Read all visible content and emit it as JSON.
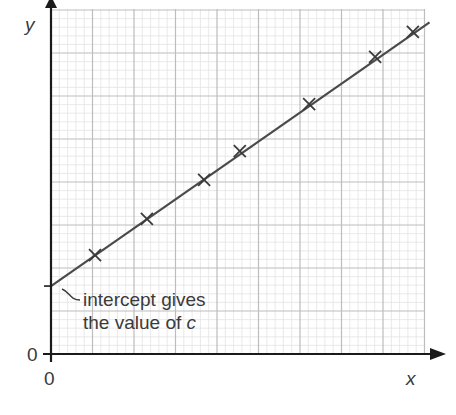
{
  "chart_data": {
    "type": "scatter",
    "title": "",
    "xlabel": "x",
    "ylabel": "y",
    "x_origin_label": "0",
    "y_origin_label": "0",
    "grid": true,
    "grid_major_cells_x": 9,
    "grid_major_cells_y": 8,
    "minor_per_major": 5,
    "xlim": [
      0,
      9
    ],
    "ylim": [
      0,
      8
    ],
    "series": [
      {
        "name": "data points",
        "marker": "x",
        "points": [
          {
            "x": 1.06,
            "y": 2.3
          },
          {
            "x": 2.31,
            "y": 3.14
          },
          {
            "x": 3.69,
            "y": 4.05
          },
          {
            "x": 4.55,
            "y": 4.72
          },
          {
            "x": 6.22,
            "y": 5.81
          },
          {
            "x": 7.81,
            "y": 6.91
          },
          {
            "x": 8.72,
            "y": 7.49
          }
        ]
      },
      {
        "name": "line of best fit",
        "type": "line",
        "points": [
          {
            "x": 0,
            "y": 1.58
          },
          {
            "x": 9.0,
            "y": 7.63
          }
        ]
      }
    ],
    "annotations": [
      {
        "text_line1": "intercept gives",
        "text_line2_prefix": "the value of ",
        "text_line2_var": "c",
        "points_to": {
          "x": 0,
          "y": 1.58
        }
      }
    ]
  },
  "colors": {
    "axis": "#1a1a1a",
    "line": "#4a4a4a",
    "marker": "#3a3a3a",
    "grid_major": "#bdbdbd",
    "grid_minor": "#e3e3e3",
    "text": "#3a3a3a"
  }
}
